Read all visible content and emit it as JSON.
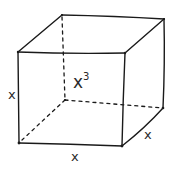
{
  "diagram": {
    "labels": {
      "height": "x",
      "width": "x",
      "depth": "x",
      "volume_base": "x",
      "volume_exponent": "3"
    },
    "vertices": {
      "front_top_left": [
        18,
        52
      ],
      "front_top_right": [
        125,
        53
      ],
      "front_bottom_left": [
        19,
        143
      ],
      "front_bottom_right": [
        122,
        146
      ],
      "back_top_left": [
        62,
        15
      ],
      "back_top_right": [
        164,
        19
      ],
      "back_bottom_left": [
        65,
        100
      ],
      "back_bottom_right": [
        163,
        108
      ]
    },
    "colors": {
      "stroke": "#1a1a1a",
      "text": "#2a2a2a",
      "background": "#ffffff"
    }
  }
}
